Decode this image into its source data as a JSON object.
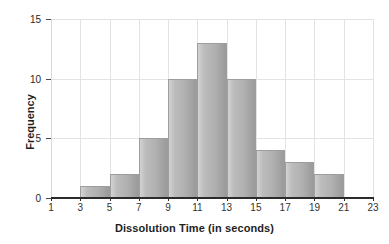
{
  "chart_data": {
    "type": "bar",
    "title": "",
    "subtitle": "",
    "xlabel": "Dissolution Time (in seconds)",
    "ylabel": "Frequency",
    "xlim": [
      1,
      23
    ],
    "ylim": [
      0,
      15
    ],
    "bin_width": 2,
    "grid": true,
    "legend": null,
    "x_tick_labels": [
      "1",
      "3",
      "5",
      "7",
      "9",
      "11",
      "13",
      "15",
      "17",
      "19",
      "21",
      "23"
    ],
    "x_tick_values": [
      1,
      3,
      5,
      7,
      9,
      11,
      13,
      15,
      17,
      19,
      21,
      23
    ],
    "y_tick_labels": [
      "0",
      "5",
      "10",
      "15"
    ],
    "y_tick_values": [
      0,
      5,
      10,
      15
    ],
    "categories": [
      "1-3",
      "3-5",
      "5-7",
      "7-9",
      "9-11",
      "11-13",
      "13-15",
      "15-17",
      "17-19",
      "19-21",
      "21-23"
    ],
    "bin_edges": [
      1,
      3,
      5,
      7,
      9,
      11,
      13,
      15,
      17,
      19,
      21,
      23
    ],
    "values": [
      0,
      1,
      2,
      5,
      10,
      13,
      10,
      4,
      3,
      2,
      0
    ],
    "bars": [
      {
        "start": 3,
        "end": 5,
        "value": 1
      },
      {
        "start": 5,
        "end": 7,
        "value": 2
      },
      {
        "start": 7,
        "end": 9,
        "value": 5
      },
      {
        "start": 9,
        "end": 11,
        "value": 10
      },
      {
        "start": 11,
        "end": 13,
        "value": 13
      },
      {
        "start": 13,
        "end": 15,
        "value": 10
      },
      {
        "start": 15,
        "end": 17,
        "value": 4
      },
      {
        "start": 17,
        "end": 19,
        "value": 3
      },
      {
        "start": 19,
        "end": 21,
        "value": 2
      }
    ],
    "colors": {
      "bar_fill_light": "#d2d2d2",
      "bar_fill_dark": "#9a9a9a",
      "bar_border": "#9d9d9d",
      "gridline": "#e3e3e3",
      "axis": "#2b2b2b",
      "text": "#1f1f1f",
      "background": "#ffffff"
    }
  }
}
